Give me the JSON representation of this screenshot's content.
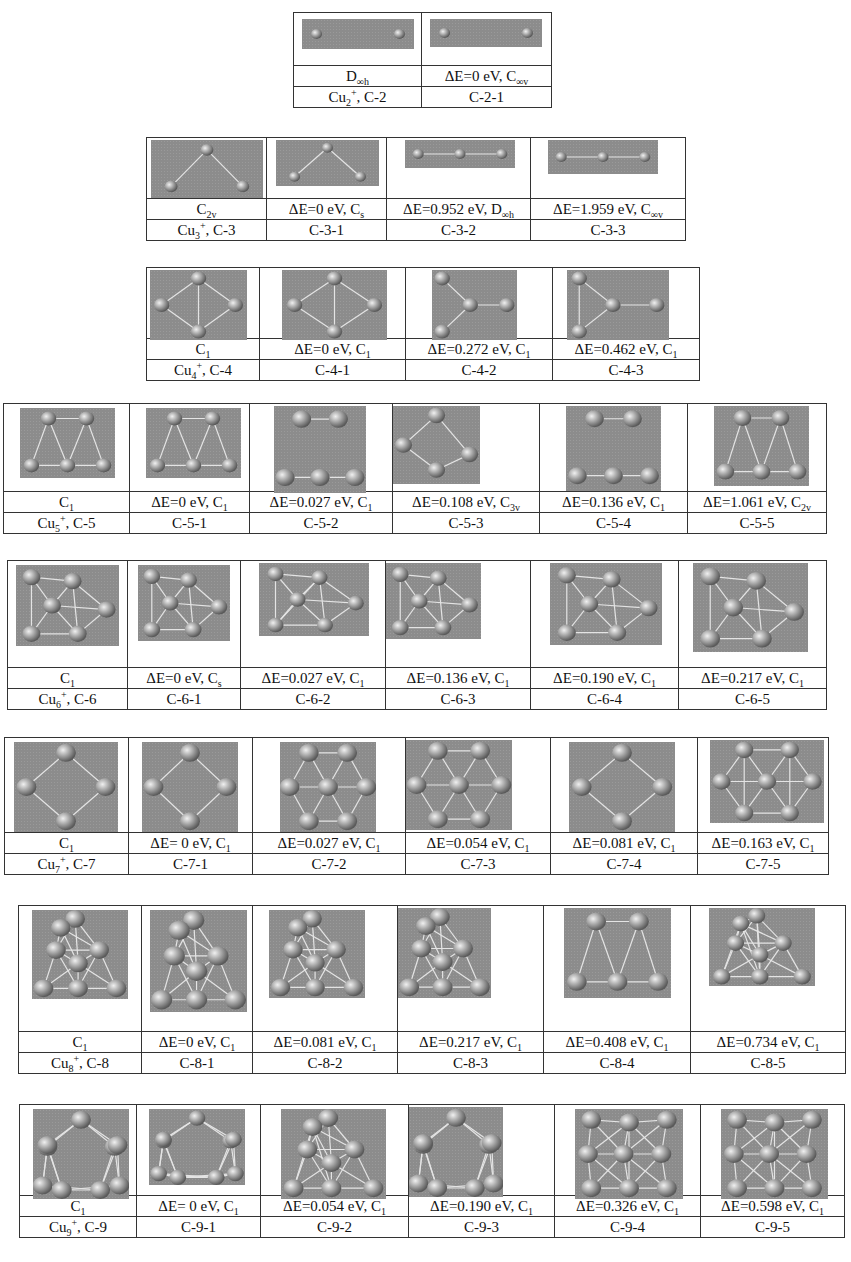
{
  "figure": {
    "groups": [
      {
        "cluster": "Cu2+",
        "cluster_label": "Cu₂⁺, C-2",
        "ref_symmetry": "D∞h",
        "isomers": [
          {
            "id": "C-2-1",
            "dE": "ΔE=0 eV",
            "sym": "C∞v"
          }
        ]
      },
      {
        "cluster": "Cu3+",
        "cluster_label": "Cu₃⁺, C-3",
        "ref_symmetry": "C2v",
        "isomers": [
          {
            "id": "C-3-1",
            "dE": "ΔE=0 eV",
            "sym": "Cs"
          },
          {
            "id": "C-3-2",
            "dE": "ΔE=0.952 eV",
            "sym": "D∞h"
          },
          {
            "id": "C-3-3",
            "dE": "ΔE=1.959 eV",
            "sym": "C∞v"
          }
        ]
      },
      {
        "cluster": "Cu4+",
        "cluster_label": "Cu₄⁺, C-4",
        "ref_symmetry": "C1",
        "isomers": [
          {
            "id": "C-4-1",
            "dE": "ΔE=0 eV",
            "sym": "C1"
          },
          {
            "id": "C-4-2",
            "dE": "ΔE=0.272 eV",
            "sym": "C1"
          },
          {
            "id": "C-4-3",
            "dE": "ΔE=0.462 eV",
            "sym": "C1"
          }
        ]
      },
      {
        "cluster": "Cu5+",
        "cluster_label": "Cu₅⁺, C-5",
        "ref_symmetry": "C1",
        "isomers": [
          {
            "id": "C-5-1",
            "dE": "ΔE=0 eV",
            "sym": "C1"
          },
          {
            "id": "C-5-2",
            "dE": "ΔE=0.027  eV",
            "sym": "C1"
          },
          {
            "id": "C-5-3",
            "dE": "ΔE=0.108 eV",
            "sym": "C3v"
          },
          {
            "id": "C-5-4",
            "dE": "ΔE=0.136 eV",
            "sym": "C1"
          },
          {
            "id": "C-5-5",
            "dE": "ΔE=1.061 eV",
            "sym": "C2v"
          }
        ]
      },
      {
        "cluster": "Cu6+",
        "cluster_label": "Cu₆⁺, C-6",
        "ref_symmetry": "C1",
        "isomers": [
          {
            "id": "C-6-1",
            "dE": "ΔE=0 eV",
            "sym": "Cs"
          },
          {
            "id": "C-6-2",
            "dE": "ΔE=0.027 eV",
            "sym": "C1"
          },
          {
            "id": "C-6-3",
            "dE": "ΔE=0.136 eV",
            "sym": "C1"
          },
          {
            "id": "C-6-4",
            "dE": "ΔE=0.190 eV",
            "sym": "C1"
          },
          {
            "id": "C-6-5",
            "dE": "ΔE=0.217 eV",
            "sym": "C1"
          }
        ]
      },
      {
        "cluster": "Cu7+",
        "cluster_label": "Cu₇⁺, C-7",
        "ref_symmetry": "C1",
        "isomers": [
          {
            "id": "C-7-1",
            "dE": "ΔE= 0 eV",
            "sym": "C1"
          },
          {
            "id": "C-7-2",
            "dE": "ΔE=0.027 eV",
            "sym": "C1"
          },
          {
            "id": "C-7-3",
            "dE": "ΔE=0.054 eV",
            "sym": "C1"
          },
          {
            "id": "C-7-4",
            "dE": "ΔE=0.081 eV",
            "sym": "C1"
          },
          {
            "id": "C-7-5",
            "dE": "ΔE=0.163 eV",
            "sym": "C1"
          }
        ]
      },
      {
        "cluster": "Cu8+",
        "cluster_label": "Cu₈⁺, C-8",
        "ref_symmetry": "C1",
        "isomers": [
          {
            "id": "C-8-1",
            "dE": "ΔE=0 eV",
            "sym": "C1"
          },
          {
            "id": "C-8-2",
            "dE": "ΔE=0.081 eV",
            "sym": "C1"
          },
          {
            "id": "C-8-3",
            "dE": "ΔE=0.217 eV",
            "sym": "C1"
          },
          {
            "id": "C-8-4",
            "dE": "ΔE=0.408 eV",
            "sym": "C1"
          },
          {
            "id": "C-8-5",
            "dE": "ΔE=0.734 eV",
            "sym": "C1"
          }
        ]
      },
      {
        "cluster": "Cu9+",
        "cluster_label": "Cu₉⁺, C-9",
        "ref_symmetry": "C1",
        "isomers": [
          {
            "id": "C-9-1",
            "dE": "ΔE= 0 eV",
            "sym": "C1"
          },
          {
            "id": "C-9-2",
            "dE": "ΔE=0.054 eV",
            "sym": "C1"
          },
          {
            "id": "C-9-3",
            "dE": "ΔE=0.190 eV",
            "sym": "C1"
          },
          {
            "id": "C-9-4",
            "dE": "ΔE=0.326 eV",
            "sym": "C1"
          },
          {
            "id": "C-9-5",
            "dE": "ΔE=0.598 eV",
            "sym": "C1"
          }
        ]
      }
    ]
  },
  "layout": {
    "tables": [
      {
        "left": 293,
        "top": 12,
        "cols": [
          128,
          130
        ],
        "img_h": 52,
        "mols": [
          [
            8,
            4,
            112,
            30,
            "d"
          ],
          [
            8,
            4,
            112,
            28,
            "d"
          ]
        ]
      },
      {
        "left": 146,
        "top": 137,
        "cols": [
          120,
          120,
          144,
          155
        ],
        "img_h": 60,
        "mols": [
          [
            4,
            0,
            112,
            58,
            "tri"
          ],
          [
            9,
            0,
            103,
            46,
            "tri"
          ],
          [
            18,
            0,
            110,
            28,
            "lin3"
          ],
          [
            17,
            0,
            110,
            34,
            "lin3"
          ]
        ]
      },
      {
        "left": 146,
        "top": 267,
        "cols": [
          113,
          146,
          147,
          147
        ],
        "img_h": 70,
        "mols": [
          [
            3,
            0,
            97,
            70,
            "rh"
          ],
          [
            22,
            0,
            105,
            70,
            "rh"
          ],
          [
            26,
            0,
            85,
            70,
            "tri4"
          ],
          [
            14,
            0,
            102,
            70,
            "tri4"
          ]
        ]
      },
      {
        "left": 3,
        "top": 403,
        "cols": [
          126,
          120,
          143,
          147,
          148,
          139
        ],
        "img_h": 87,
        "mols": [
          [
            16,
            2,
            95,
            70,
            "tr5"
          ],
          [
            16,
            2,
            95,
            70,
            "tr5"
          ],
          [
            24,
            0,
            92,
            87,
            "tr5"
          ],
          [
            0,
            0,
            87,
            78,
            "kite"
          ],
          [
            26,
            0,
            95,
            85,
            "tr5"
          ],
          [
            26,
            0,
            95,
            80,
            "tr5"
          ]
        ]
      },
      {
        "left": 7,
        "top": 560,
        "cols": [
          120,
          113,
          145,
          145,
          148,
          148
        ],
        "img_h": 106,
        "mols": [
          [
            8,
            2,
            103,
            81,
            "hex6"
          ],
          [
            10,
            2,
            92,
            76,
            "hex6"
          ],
          [
            18,
            0,
            110,
            73,
            "hex6"
          ],
          [
            0,
            0,
            95,
            76,
            "hex6"
          ],
          [
            19,
            0,
            112,
            82,
            "hex6"
          ],
          [
            14,
            0,
            115,
            89,
            "hex6"
          ]
        ]
      },
      {
        "left": 4,
        "top": 737,
        "cols": [
          124,
          124,
          153,
          145,
          147,
          131
        ],
        "img_h": 94,
        "mols": [
          [
            9,
            2,
            104,
            90,
            "rh"
          ],
          [
            13,
            2,
            96,
            90,
            "rh"
          ],
          [
            27,
            2,
            96,
            90,
            "hex7"
          ],
          [
            0,
            0,
            106,
            90,
            "hex7"
          ],
          [
            18,
            2,
            106,
            90,
            "rh"
          ],
          [
            12,
            0,
            114,
            83,
            "hex7"
          ]
        ]
      },
      {
        "left": 18,
        "top": 905,
        "cols": [
          123,
          111,
          145,
          146,
          147,
          155
        ],
        "img_h": 125,
        "mols": [
          [
            13,
            2,
            96,
            89,
            "hex8"
          ],
          [
            8,
            2,
            97,
            102,
            "hex8"
          ],
          [
            16,
            2,
            96,
            88,
            "hex8"
          ],
          [
            0,
            0,
            93,
            90,
            "hex8"
          ],
          [
            20,
            0,
            107,
            90,
            "tr5"
          ],
          [
            18,
            0,
            106,
            78,
            "hex8"
          ]
        ]
      },
      {
        "left": 19,
        "top": 1104,
        "cols": [
          117,
          124,
          148,
          146,
          146,
          144
        ],
        "img_h": 90,
        "mols": [
          [
            13,
            2,
            96,
            90,
            "pent9"
          ],
          [
            12,
            2,
            96,
            76,
            "pent9"
          ],
          [
            20,
            2,
            105,
            90,
            "hex8"
          ],
          [
            0,
            0,
            94,
            90,
            "pent9"
          ],
          [
            20,
            2,
            108,
            90,
            "hex9"
          ],
          [
            20,
            2,
            107,
            90,
            "hex9"
          ]
        ]
      }
    ]
  },
  "colors": {
    "border": "#333333",
    "mol_bg": "#8c8c8c",
    "atom": "#b5b5b5",
    "atom_hi": "#f0f0f0",
    "bond": "#e4e4e4"
  }
}
